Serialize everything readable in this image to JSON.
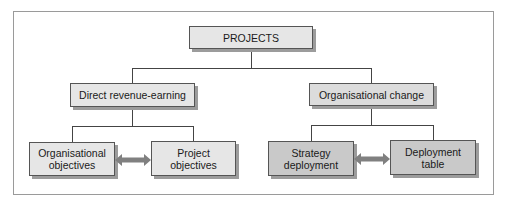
{
  "diagram": {
    "type": "hierarchy",
    "root": {
      "label": "PROJECTS"
    },
    "branches": [
      {
        "label": "Direct revenue-earning",
        "children": [
          {
            "line1": "Organisational",
            "line2": "objectives"
          },
          {
            "line1": "Project",
            "line2": "objectives"
          }
        ],
        "link": "bidirectional-arrow"
      },
      {
        "label": "Organisational change",
        "children": [
          {
            "line1": "Strategy",
            "line2": "deployment"
          },
          {
            "line1": "Deployment",
            "line2": "table"
          }
        ],
        "link": "bidirectional-arrow"
      }
    ]
  },
  "colors": {
    "frame_border": "#9a9a9a",
    "box_border": "#555555",
    "box_light": "#e6e6e6",
    "box_dark": "#c9c9c9",
    "shadow": "#9c9c9c",
    "connector": "#444444",
    "arrow": "#808080"
  }
}
